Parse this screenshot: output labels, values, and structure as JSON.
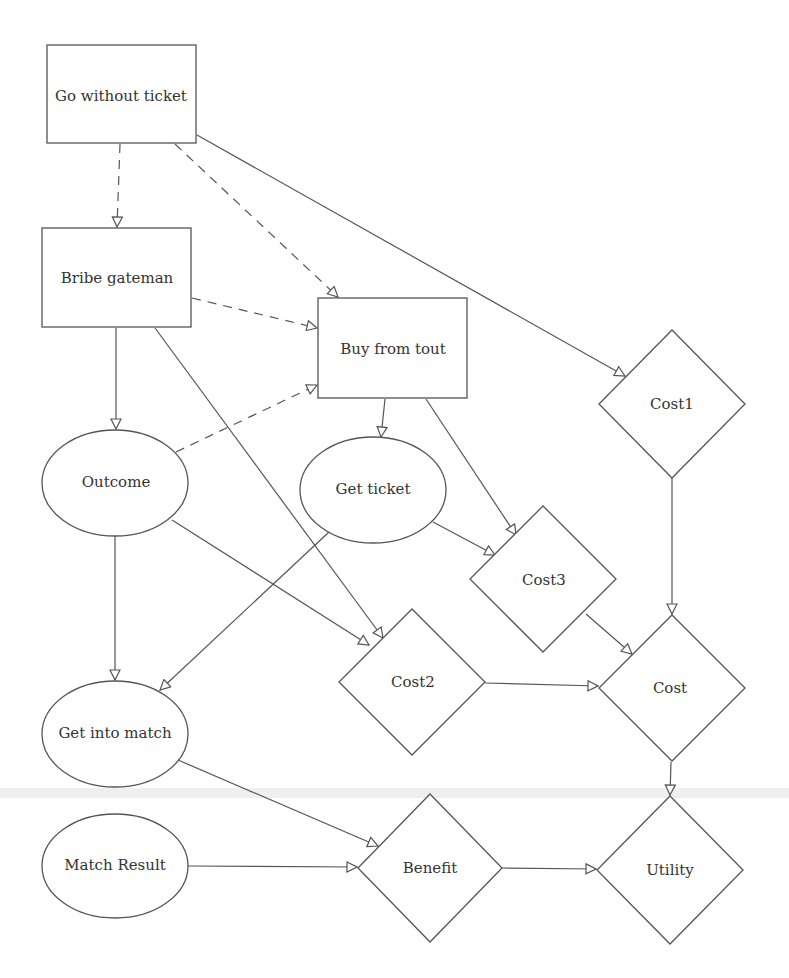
{
  "diagram": {
    "type": "influence-diagram",
    "nodes": [
      {
        "id": "go_without_ticket",
        "label": "Go without ticket",
        "shape": "rect",
        "kind": "decision"
      },
      {
        "id": "bribe_gateman",
        "label": "Bribe gateman",
        "shape": "rect",
        "kind": "decision"
      },
      {
        "id": "buy_from_tout",
        "label": "Buy from tout",
        "shape": "rect",
        "kind": "decision"
      },
      {
        "id": "outcome",
        "label": "Outcome",
        "shape": "ellipse",
        "kind": "chance"
      },
      {
        "id": "get_ticket",
        "label": "Get ticket",
        "shape": "ellipse",
        "kind": "chance"
      },
      {
        "id": "get_into_match",
        "label": "Get into match",
        "shape": "ellipse",
        "kind": "chance"
      },
      {
        "id": "match_result",
        "label": "Match Result",
        "shape": "ellipse",
        "kind": "chance"
      },
      {
        "id": "cost1",
        "label": "Cost1",
        "shape": "diamond",
        "kind": "utility"
      },
      {
        "id": "cost2",
        "label": "Cost2",
        "shape": "diamond",
        "kind": "utility"
      },
      {
        "id": "cost3",
        "label": "Cost3",
        "shape": "diamond",
        "kind": "utility"
      },
      {
        "id": "cost",
        "label": "Cost",
        "shape": "diamond",
        "kind": "utility"
      },
      {
        "id": "benefit",
        "label": "Benefit",
        "shape": "diamond",
        "kind": "utility"
      },
      {
        "id": "utility",
        "label": "Utility",
        "shape": "diamond",
        "kind": "utility"
      }
    ],
    "edges": [
      {
        "from": "go_without_ticket",
        "to": "bribe_gateman",
        "style": "dashed"
      },
      {
        "from": "go_without_ticket",
        "to": "buy_from_tout",
        "style": "dashed"
      },
      {
        "from": "go_without_ticket",
        "to": "cost1",
        "style": "solid"
      },
      {
        "from": "bribe_gateman",
        "to": "buy_from_tout",
        "style": "dashed"
      },
      {
        "from": "bribe_gateman",
        "to": "outcome",
        "style": "solid"
      },
      {
        "from": "bribe_gateman",
        "to": "cost2",
        "style": "solid"
      },
      {
        "from": "outcome",
        "to": "buy_from_tout",
        "style": "dashed"
      },
      {
        "from": "outcome",
        "to": "get_into_match",
        "style": "solid"
      },
      {
        "from": "outcome",
        "to": "cost2",
        "style": "solid"
      },
      {
        "from": "buy_from_tout",
        "to": "get_ticket",
        "style": "solid"
      },
      {
        "from": "buy_from_tout",
        "to": "cost3",
        "style": "solid"
      },
      {
        "from": "get_ticket",
        "to": "cost3",
        "style": "solid"
      },
      {
        "from": "get_ticket",
        "to": "get_into_match",
        "style": "solid"
      },
      {
        "from": "cost1",
        "to": "cost",
        "style": "solid"
      },
      {
        "from": "cost3",
        "to": "cost",
        "style": "solid"
      },
      {
        "from": "cost2",
        "to": "cost",
        "style": "solid"
      },
      {
        "from": "get_into_match",
        "to": "benefit",
        "style": "solid"
      },
      {
        "from": "match_result",
        "to": "benefit",
        "style": "solid"
      },
      {
        "from": "benefit",
        "to": "utility",
        "style": "solid"
      },
      {
        "from": "cost",
        "to": "utility",
        "style": "solid"
      }
    ],
    "labels": {
      "go_without_ticket": "Go without ticket",
      "bribe_gateman": "Bribe gateman",
      "buy_from_tout": "Buy from tout",
      "outcome": "Outcome",
      "get_ticket": "Get ticket",
      "get_into_match": "Get into match",
      "match_result": "Match Result",
      "cost1": "Cost1",
      "cost2": "Cost2",
      "cost3": "Cost3",
      "cost": "Cost",
      "benefit": "Benefit",
      "utility": "Utility"
    },
    "colors": {
      "stroke": "#555555",
      "text": "#333333",
      "background": "#ffffff"
    }
  }
}
